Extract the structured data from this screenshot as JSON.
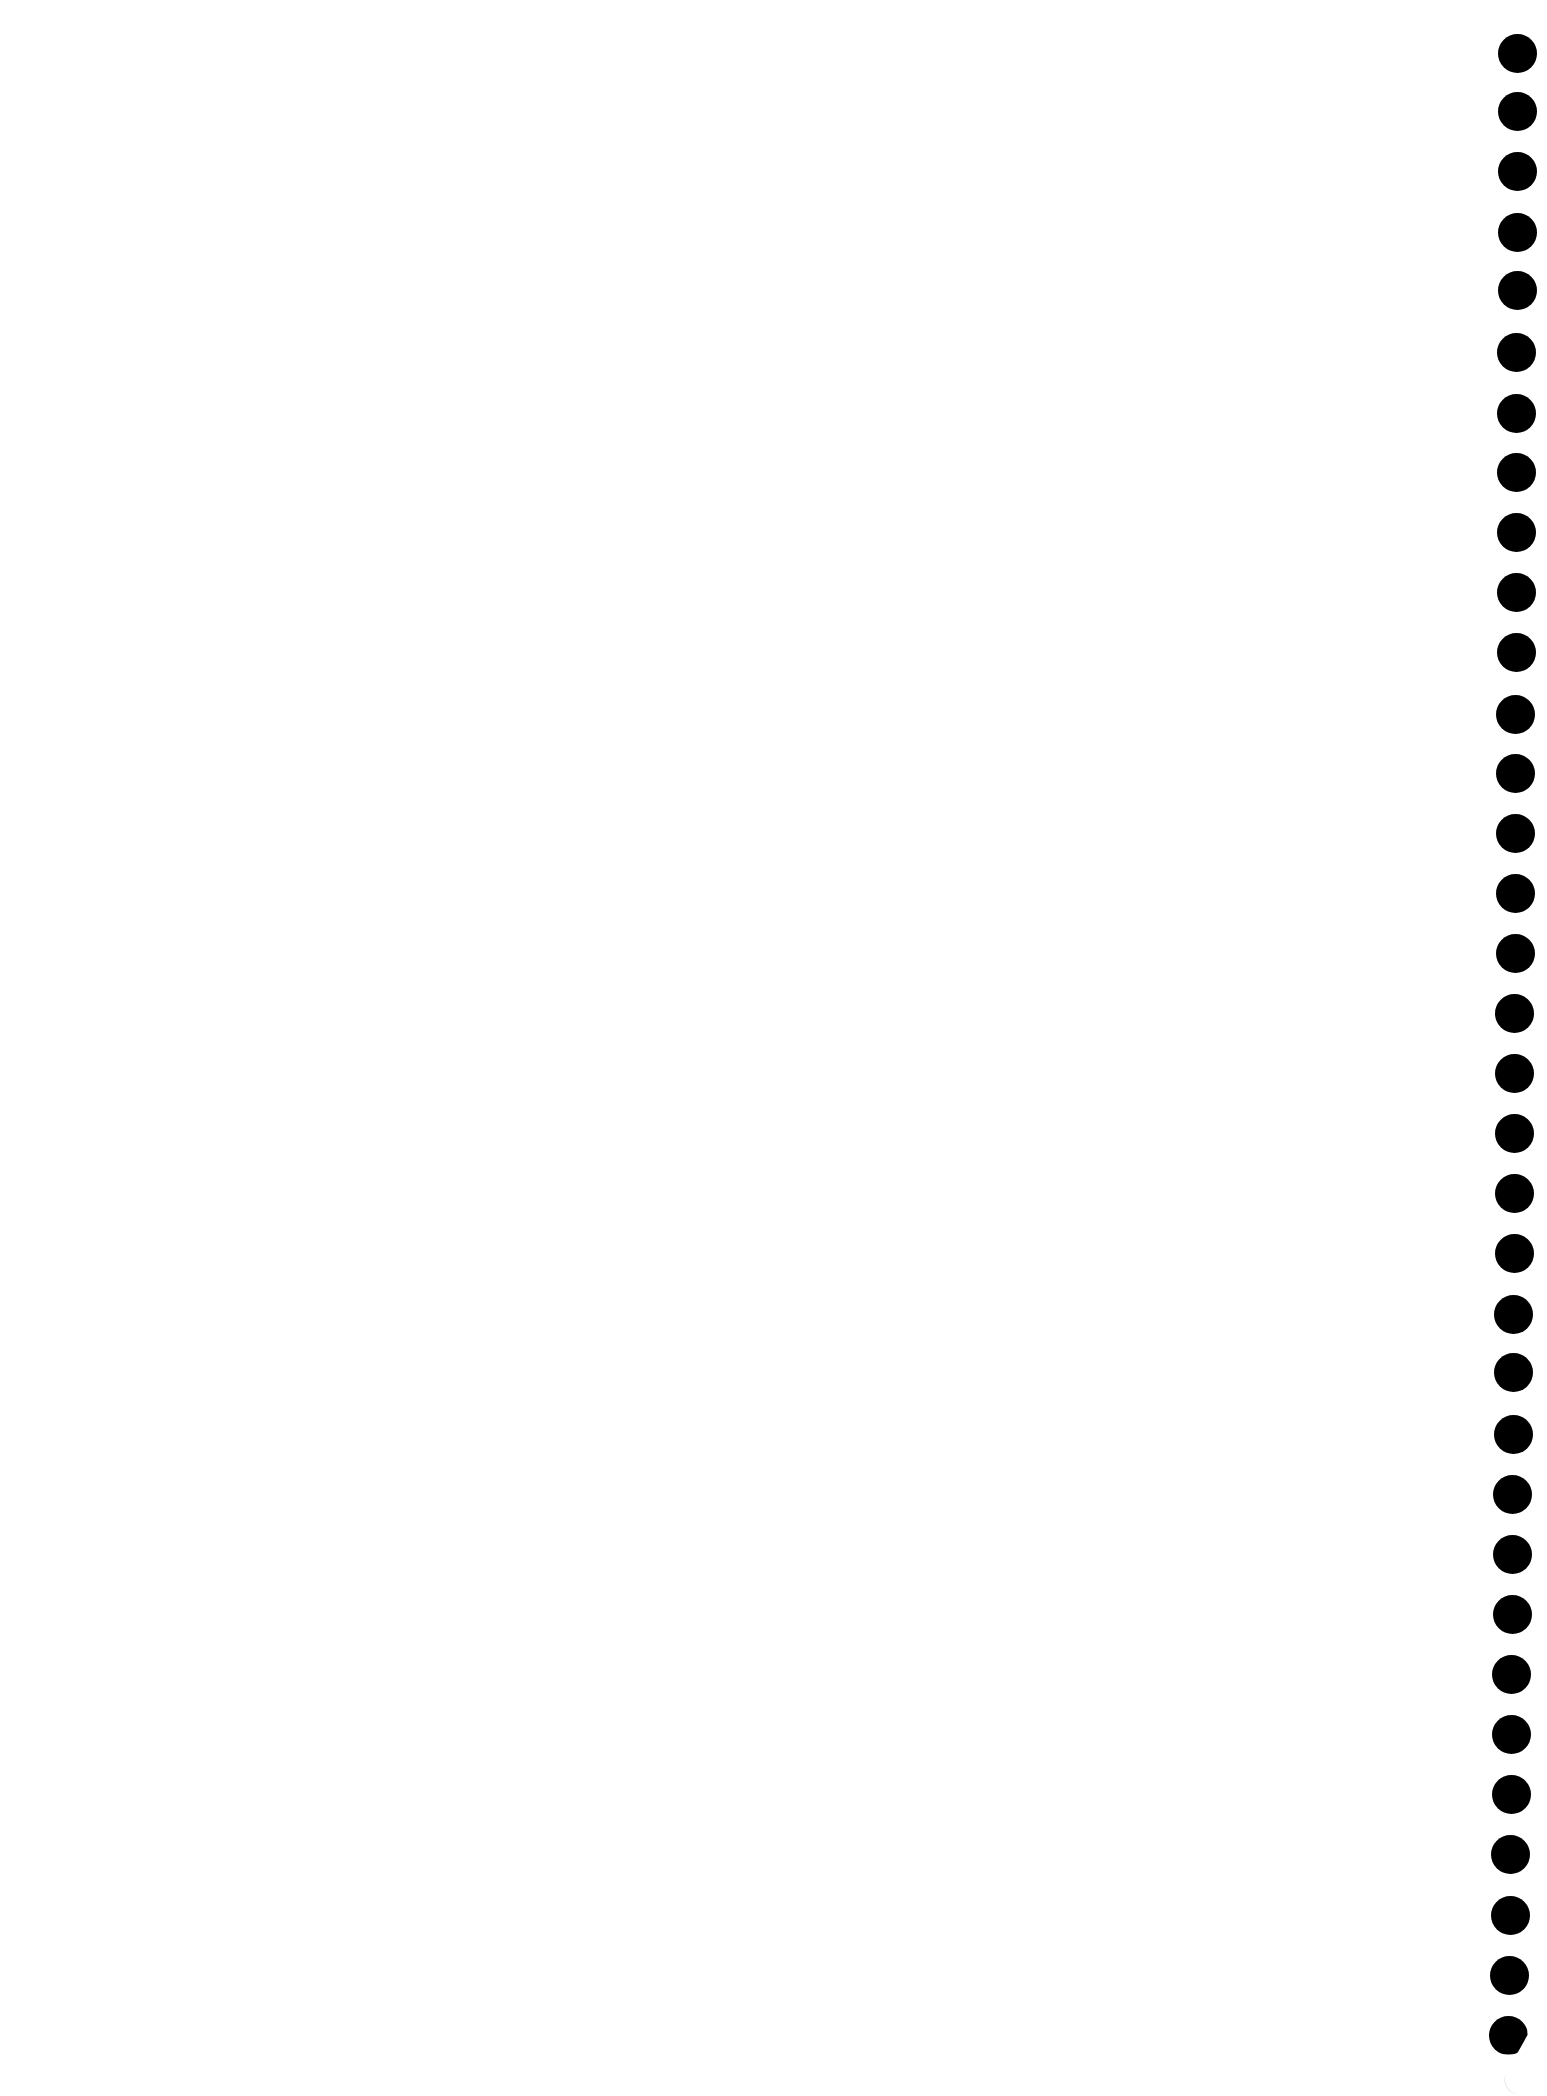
{
  "page": {
    "type": "notebook-page",
    "background_color": "#ffffff",
    "content_text": ""
  },
  "binding_holes": {
    "color": "#000000",
    "diameter_px": 39,
    "positions": [
      {
        "x": 1517,
        "y": 53
      },
      {
        "x": 1517,
        "y": 111
      },
      {
        "x": 1517,
        "y": 171
      },
      {
        "x": 1517,
        "y": 232
      },
      {
        "x": 1517,
        "y": 290
      },
      {
        "x": 1516,
        "y": 352
      },
      {
        "x": 1516,
        "y": 413
      },
      {
        "x": 1516,
        "y": 472
      },
      {
        "x": 1516,
        "y": 532
      },
      {
        "x": 1516,
        "y": 592
      },
      {
        "x": 1516,
        "y": 652
      },
      {
        "x": 1515,
        "y": 714
      },
      {
        "x": 1515,
        "y": 773
      },
      {
        "x": 1515,
        "y": 833
      },
      {
        "x": 1515,
        "y": 893
      },
      {
        "x": 1515,
        "y": 953
      },
      {
        "x": 1514,
        "y": 1013
      },
      {
        "x": 1514,
        "y": 1073
      },
      {
        "x": 1514,
        "y": 1133
      },
      {
        "x": 1514,
        "y": 1193
      },
      {
        "x": 1514,
        "y": 1253
      },
      {
        "x": 1513,
        "y": 1314
      },
      {
        "x": 1513,
        "y": 1372
      },
      {
        "x": 1513,
        "y": 1434
      },
      {
        "x": 1512,
        "y": 1494
      },
      {
        "x": 1512,
        "y": 1554
      },
      {
        "x": 1512,
        "y": 1614
      },
      {
        "x": 1511,
        "y": 1674
      },
      {
        "x": 1511,
        "y": 1734
      },
      {
        "x": 1511,
        "y": 1794
      },
      {
        "x": 1510,
        "y": 1854
      },
      {
        "x": 1510,
        "y": 1915
      },
      {
        "x": 1509,
        "y": 1975
      },
      {
        "x": 1508,
        "y": 2035,
        "partial": true
      }
    ],
    "tear_mark": {
      "x": 1505,
      "y": 2072
    }
  }
}
